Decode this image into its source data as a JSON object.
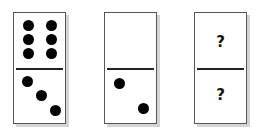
{
  "puzzle": {
    "dominoes": [
      {
        "top": "6",
        "bottom": "3"
      },
      {
        "top": "0",
        "bottom": "2"
      },
      {
        "top": "?",
        "bottom": "?"
      }
    ],
    "unknown_symbol": "?"
  }
}
